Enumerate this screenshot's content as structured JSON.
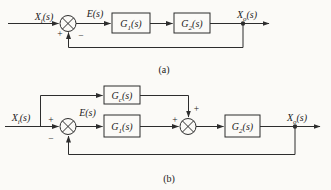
{
  "figure": {
    "background_color": "#fbfaf7",
    "line_color": "#2d2d2d",
    "text_color": "#1b1b1b"
  },
  "diagram_a": {
    "caption": "(a)",
    "labels": {
      "input": {
        "base": "X",
        "sub": "i",
        "arg": "(s)"
      },
      "error": {
        "base": "E",
        "arg": "(s)"
      },
      "output": {
        "base": "X",
        "sub": "o",
        "arg": "(s)"
      }
    },
    "blocks": {
      "g1": {
        "base": "G",
        "sub": "1",
        "arg": "(s)"
      },
      "g2": {
        "base": "G",
        "sub": "2",
        "arg": "(s)"
      }
    },
    "signs": {
      "input_plus": "+",
      "feedback_minus": "−"
    }
  },
  "diagram_b": {
    "caption": "(b)",
    "labels": {
      "input": {
        "base": "X",
        "sub": "i",
        "arg": "(s)"
      },
      "error": {
        "base": "E",
        "arg": "(s)"
      },
      "output": {
        "base": "X",
        "sub": "o",
        "arg": "(s)"
      }
    },
    "blocks": {
      "gc": {
        "base": "G",
        "sub": "c",
        "arg": "(s)"
      },
      "g1": {
        "base": "G",
        "sub": "1",
        "arg": "(s)"
      },
      "g2": {
        "base": "G",
        "sub": "2",
        "arg": "(s)"
      }
    },
    "signs": {
      "input_plus": "+",
      "feedback_minus": "−",
      "sum2_left_plus": "+",
      "sum2_top_plus": "+"
    }
  }
}
